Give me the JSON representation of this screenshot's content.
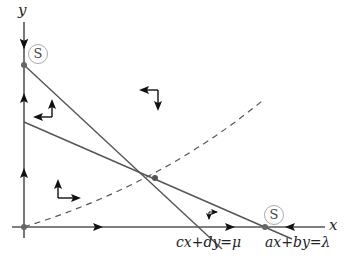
{
  "diagram": {
    "type": "phase-plane",
    "axes": {
      "x_label": "x",
      "y_label": "y"
    },
    "lines": [
      {
        "id": "line-mu",
        "equation": "cx+dy=μ"
      },
      {
        "id": "line-lambda",
        "equation": "ax+by=λ"
      }
    ],
    "nullcline_curve": {
      "style": "dashed"
    },
    "fixed_points": [
      {
        "id": "origin",
        "label": ""
      },
      {
        "id": "y-axis-point",
        "label": "S"
      },
      {
        "id": "x-axis-point",
        "label": "S"
      },
      {
        "id": "interior-intersection",
        "label": ""
      }
    ],
    "colors": {
      "line": "#555555",
      "axis": "#555555",
      "point": "#666666",
      "arrow": "#111111"
    }
  }
}
